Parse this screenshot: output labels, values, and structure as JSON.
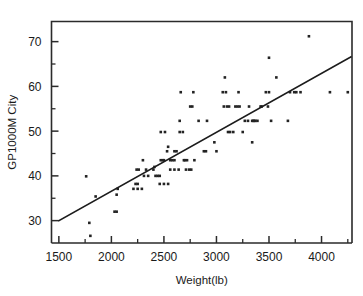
{
  "chart_data": {
    "type": "scatter",
    "title": "",
    "xlabel": "Weight(lb)",
    "ylabel": "GP1000M City",
    "xlim": [
      1430,
      4290
    ],
    "ylim": [
      25.0,
      74.5
    ],
    "grid": false,
    "legend": null,
    "x_ticks_major": [
      1500,
      2000,
      2500,
      3000,
      3500,
      4000
    ],
    "x_ticks_minor": [
      1750,
      2250,
      2750,
      3250,
      3750,
      4250
    ],
    "y_ticks_major": [
      30,
      40,
      50,
      60,
      70
    ],
    "y_ticks_minor": [
      35,
      45,
      55,
      65
    ],
    "x_ticklabels": [
      "1500",
      "2000",
      "2500",
      "3000",
      "3500",
      "4000"
    ],
    "y_ticklabels": [
      "30",
      "40",
      "50",
      "60",
      "70"
    ],
    "series": [
      {
        "name": "observations",
        "marker": "square",
        "color": "#232323",
        "points": [
          [
            1760,
            39.9
          ],
          [
            1790,
            29.5
          ],
          [
            1800,
            26.6
          ],
          [
            1850,
            35.4
          ],
          [
            2030,
            32.0
          ],
          [
            2050,
            32.0
          ],
          [
            2060,
            37.1
          ],
          [
            2050,
            35.8
          ],
          [
            2210,
            37.1
          ],
          [
            2240,
            41.4
          ],
          [
            2260,
            41.4
          ],
          [
            2230,
            38.2
          ],
          [
            2250,
            38.2
          ],
          [
            2250,
            37.1
          ],
          [
            2290,
            37.1
          ],
          [
            2300,
            43.5
          ],
          [
            2310,
            40.0
          ],
          [
            2330,
            41.4
          ],
          [
            2350,
            40.0
          ],
          [
            2400,
            41.4
          ],
          [
            2410,
            42.0
          ],
          [
            2420,
            40.0
          ],
          [
            2440,
            40.0
          ],
          [
            2460,
            40.0
          ],
          [
            2470,
            43.5
          ],
          [
            2490,
            43.5
          ],
          [
            2500,
            43.5
          ],
          [
            2470,
            49.8
          ],
          [
            2510,
            49.8
          ],
          [
            2500,
            38.2
          ],
          [
            2460,
            38.2
          ],
          [
            2540,
            38.2
          ],
          [
            2530,
            45.5
          ],
          [
            2540,
            46.5
          ],
          [
            2560,
            43.5
          ],
          [
            2580,
            43.5
          ],
          [
            2600,
            43.5
          ],
          [
            2560,
            41.4
          ],
          [
            2600,
            41.4
          ],
          [
            2640,
            41.4
          ],
          [
            2600,
            45.5
          ],
          [
            2620,
            45.5
          ],
          [
            2650,
            52.3
          ],
          [
            2660,
            58.7
          ],
          [
            2650,
            49.8
          ],
          [
            2680,
            49.8
          ],
          [
            2690,
            43.5
          ],
          [
            2700,
            43.5
          ],
          [
            2720,
            43.5
          ],
          [
            2710,
            41.4
          ],
          [
            2740,
            41.4
          ],
          [
            2760,
            41.4
          ],
          [
            2750,
            55.5
          ],
          [
            2770,
            55.5
          ],
          [
            2780,
            58.7
          ],
          [
            2790,
            43.5
          ],
          [
            2830,
            52.3
          ],
          [
            2880,
            45.5
          ],
          [
            2900,
            45.5
          ],
          [
            2910,
            52.3
          ],
          [
            2980,
            47.5
          ],
          [
            3000,
            45.5
          ],
          [
            3060,
            58.7
          ],
          [
            3090,
            58.7
          ],
          [
            3080,
            62.0
          ],
          [
            3070,
            55.5
          ],
          [
            3100,
            55.5
          ],
          [
            3120,
            55.5
          ],
          [
            3110,
            49.8
          ],
          [
            3130,
            49.8
          ],
          [
            3160,
            49.8
          ],
          [
            3180,
            55.5
          ],
          [
            3200,
            55.5
          ],
          [
            3220,
            55.5
          ],
          [
            3210,
            58.7
          ],
          [
            3250,
            49.8
          ],
          [
            3270,
            52.3
          ],
          [
            3300,
            52.3
          ],
          [
            3310,
            55.5
          ],
          [
            3340,
            52.3
          ],
          [
            3350,
            52.3
          ],
          [
            3360,
            52.3
          ],
          [
            3370,
            52.3
          ],
          [
            3390,
            52.3
          ],
          [
            3340,
            47.5
          ],
          [
            3420,
            55.5
          ],
          [
            3430,
            55.5
          ],
          [
            3470,
            58.7
          ],
          [
            3500,
            58.7
          ],
          [
            3490,
            55.5
          ],
          [
            3500,
            66.4
          ],
          [
            3570,
            62.0
          ],
          [
            3520,
            52.3
          ],
          [
            3680,
            52.3
          ],
          [
            3700,
            58.7
          ],
          [
            3740,
            58.7
          ],
          [
            3760,
            58.7
          ],
          [
            3800,
            58.7
          ],
          [
            3880,
            71.2
          ],
          [
            4080,
            58.7
          ],
          [
            4250,
            58.7
          ]
        ]
      }
    ],
    "fit_line": {
      "name": "linear-regression-line",
      "x_start": 1500,
      "y_start": 30.0,
      "x_end": 4280,
      "y_end": 66.6
    }
  }
}
